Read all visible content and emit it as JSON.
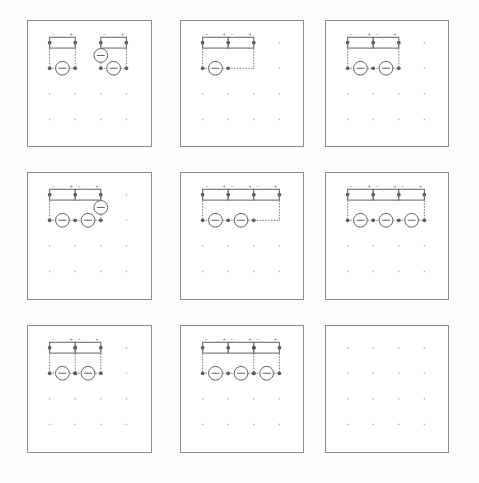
{
  "figure": {
    "background_color": "#fefefe",
    "panel_border_color": "#8d8d8d",
    "wire_color": "#7a7a7a",
    "node_color": "#5c5c5c",
    "symbol_color": "#5e5e5e",
    "grid_dot_color": "#b9b9b9",
    "rows": 3,
    "columns": 3
  },
  "grid": {
    "dots_per_row": 4,
    "dots_per_column": 4,
    "dot_spacing_x": 26,
    "dot_spacing_y": 26,
    "origin_x": 22,
    "origin_y": 22
  },
  "symbols": {
    "resistor": {
      "name": "resistor",
      "shape": "rectangle",
      "width": 26,
      "height": 11
    },
    "source": {
      "name": "dc-source",
      "shape": "circle-with-bar",
      "radius": 7
    },
    "node": {
      "name": "junction-node",
      "shape": "filled-dot",
      "radius": 1.9
    },
    "polarity_minus": "−",
    "polarity_plus": "+"
  },
  "panels": [
    {
      "id": "panel-1",
      "position": {
        "row": 1,
        "col": 1
      },
      "label": "Two independent single-loop circuits",
      "resistor_count": 2,
      "source_count": 3,
      "loops": 2,
      "left": 27,
      "top": 20,
      "width": 125,
      "height": 127,
      "circuits": [
        {
          "name": "loop-a",
          "resistors": 1,
          "sources": 1,
          "source_placement": "bottom"
        },
        {
          "name": "loop-b",
          "resistors": 1,
          "sources": 2,
          "source_placement": "left-and-bottom"
        }
      ]
    },
    {
      "id": "panel-2",
      "position": {
        "row": 1,
        "col": 2
      },
      "label": "Two resistors in series with one source",
      "resistor_count": 2,
      "source_count": 1,
      "loops": 1,
      "left": 180,
      "top": 20,
      "width": 124,
      "height": 127,
      "circuits": [
        {
          "name": "loop-a",
          "resistors": 2,
          "sources": 1,
          "source_placement": "bottom"
        }
      ]
    },
    {
      "id": "panel-3",
      "position": {
        "row": 1,
        "col": 3
      },
      "label": "Two resistors in series with two sources",
      "resistor_count": 2,
      "source_count": 2,
      "loops": 1,
      "left": 325,
      "top": 20,
      "width": 124,
      "height": 127,
      "circuits": [
        {
          "name": "loop-a",
          "resistors": 2,
          "sources": 2,
          "source_placement": "bottom"
        }
      ]
    },
    {
      "id": "panel-4",
      "position": {
        "row": 2,
        "col": 1
      },
      "label": "Two resistors, two bottom sources and one side source",
      "resistor_count": 2,
      "source_count": 3,
      "loops": 1,
      "left": 27,
      "top": 172,
      "width": 125,
      "height": 128,
      "circuits": [
        {
          "name": "loop-a",
          "resistors": 2,
          "sources": 3,
          "source_placement": "bottom-and-right"
        }
      ]
    },
    {
      "id": "panel-5",
      "position": {
        "row": 2,
        "col": 2
      },
      "label": "Three resistors in series with two sources",
      "resistor_count": 3,
      "source_count": 2,
      "loops": 1,
      "left": 180,
      "top": 172,
      "width": 124,
      "height": 128,
      "circuits": [
        {
          "name": "loop-a",
          "resistors": 3,
          "sources": 2,
          "source_placement": "bottom"
        }
      ]
    },
    {
      "id": "panel-6",
      "position": {
        "row": 2,
        "col": 3
      },
      "label": "Three resistors in series with three sources",
      "resistor_count": 3,
      "source_count": 3,
      "loops": 1,
      "left": 325,
      "top": 172,
      "width": 124,
      "height": 128,
      "circuits": [
        {
          "name": "loop-a",
          "resistors": 3,
          "sources": 3,
          "source_placement": "bottom"
        }
      ]
    },
    {
      "id": "panel-7",
      "position": {
        "row": 3,
        "col": 1
      },
      "label": "Two resistors with centre branch and two sources",
      "resistor_count": 2,
      "source_count": 2,
      "loops": 2,
      "left": 27,
      "top": 325,
      "width": 125,
      "height": 128,
      "circuits": [
        {
          "name": "loop-a",
          "resistors": 2,
          "sources": 2,
          "source_placement": "bottom",
          "centre_branch": true
        }
      ]
    },
    {
      "id": "panel-8",
      "position": {
        "row": 3,
        "col": 2
      },
      "label": "Three resistors with centre branch and three sources",
      "resistor_count": 3,
      "source_count": 3,
      "loops": 2,
      "left": 180,
      "top": 325,
      "width": 124,
      "height": 128,
      "circuits": [
        {
          "name": "loop-a",
          "resistors": 3,
          "sources": 3,
          "source_placement": "bottom",
          "centre_branch": true
        }
      ]
    },
    {
      "id": "panel-9",
      "position": {
        "row": 3,
        "col": 3
      },
      "label": "Empty grid panel",
      "resistor_count": 0,
      "source_count": 0,
      "loops": 0,
      "left": 325,
      "top": 325,
      "width": 124,
      "height": 128,
      "circuits": []
    }
  ]
}
